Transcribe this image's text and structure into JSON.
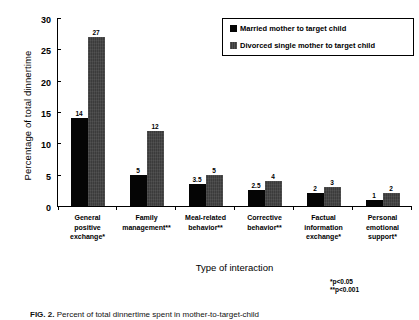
{
  "chart_data": {
    "type": "bar",
    "title": "",
    "xlabel": "Type of interaction",
    "ylabel": "Percentage of total dinnertime",
    "ylim": [
      0,
      30
    ],
    "yticks": [
      0,
      5,
      10,
      15,
      20,
      25,
      30
    ],
    "grid": false,
    "legend_position": "top-right",
    "categories": [
      "General positive exchange*",
      "Family management**",
      "Meal-related behavior**",
      "Corrective behavior**",
      "Factual information exchange*",
      "Personal emotional support*"
    ],
    "category_lines": [
      [
        "General",
        "positive",
        "exchange*"
      ],
      [
        "Family",
        "management**"
      ],
      [
        "Meal-related",
        "behavior**"
      ],
      [
        "Corrective",
        "behavior**"
      ],
      [
        "Factual",
        "information",
        "exchange*"
      ],
      [
        "Personal",
        "emotional",
        "support*"
      ]
    ],
    "series": [
      {
        "name": "Married mother to target child",
        "color": "#050505",
        "values": [
          14,
          5,
          3.5,
          2.5,
          2,
          1
        ],
        "labels": [
          "14",
          "5",
          "3.5",
          "2.5",
          "2",
          "1"
        ]
      },
      {
        "name": "Divorced single mother to target child",
        "color": "#3b3b3b",
        "values": [
          27,
          12,
          5,
          4,
          3,
          2
        ],
        "labels": [
          "27",
          "12",
          "5",
          "4",
          "3",
          "2"
        ]
      }
    ],
    "annotations": [
      "*p<0.05",
      "**p<0.001"
    ]
  },
  "legend": {
    "items": [
      {
        "label": "Married mother to target child"
      },
      {
        "label": "Divorced single mother to target child"
      }
    ]
  },
  "notes": {
    "line1": "*p<0.05",
    "line2": "**p<0.001"
  },
  "caption": {
    "figure_number": "FIG. 2.",
    "text": "Percent of total dinnertime spent in mother-to-target-child"
  }
}
